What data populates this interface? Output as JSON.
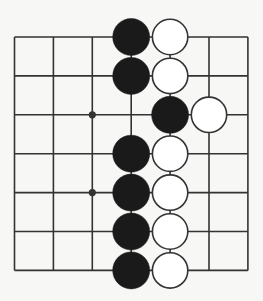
{
  "diagram": {
    "type": "go-board-fragment",
    "grid": {
      "columns": 7,
      "rows": 7,
      "origin_x": 14.5,
      "origin_y": 37,
      "spacing_x": 38.9,
      "spacing_y": 38.9
    },
    "colors": {
      "background": "#f7f7f5",
      "line": "#333333",
      "black_stone": "#1a1a1a",
      "white_stone_fill": "#ffffff",
      "white_stone_stroke": "#333333"
    },
    "stone_radius": 18.5,
    "star_points": [
      {
        "col": 2,
        "row": 2
      },
      {
        "col": 2,
        "row": 4
      }
    ],
    "stones": [
      {
        "color": "black",
        "col": 3,
        "row": 0
      },
      {
        "color": "white",
        "col": 4,
        "row": 0
      },
      {
        "color": "black",
        "col": 3,
        "row": 1
      },
      {
        "color": "white",
        "col": 4,
        "row": 1
      },
      {
        "color": "black",
        "col": 4,
        "row": 2
      },
      {
        "color": "white",
        "col": 5,
        "row": 2
      },
      {
        "color": "black",
        "col": 3,
        "row": 3
      },
      {
        "color": "white",
        "col": 4,
        "row": 3
      },
      {
        "color": "black",
        "col": 3,
        "row": 4
      },
      {
        "color": "white",
        "col": 4,
        "row": 4
      },
      {
        "color": "black",
        "col": 3,
        "row": 5
      },
      {
        "color": "white",
        "col": 4,
        "row": 5
      },
      {
        "color": "black",
        "col": 3,
        "row": 6
      },
      {
        "color": "white",
        "col": 4,
        "row": 6
      }
    ]
  }
}
